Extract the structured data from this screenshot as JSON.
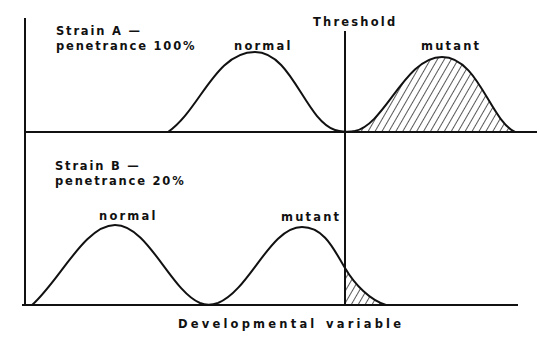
{
  "diagram": {
    "type": "penetrance threshold distributions",
    "threshold_label": "Threshold",
    "x_axis_label_left": "Developmental",
    "x_axis_label_right": "variable",
    "panels": [
      {
        "id": "strain-a",
        "title_line1": "Strain  A —",
        "title_line2": "penetrance  100%",
        "strain": "Strain A",
        "penetrance": "100%",
        "curves": [
          {
            "label": "normal",
            "hatched_beyond_threshold": false
          },
          {
            "label": "mutant",
            "hatched_beyond_threshold": true
          }
        ]
      },
      {
        "id": "strain-b",
        "title_line1": "Strain  B —",
        "title_line2": "penetrance  20%",
        "strain": "Strain B",
        "penetrance": "20%",
        "curves": [
          {
            "label": "normal",
            "hatched_beyond_threshold": false
          },
          {
            "label": "mutant",
            "hatched_beyond_threshold": true
          }
        ]
      }
    ],
    "colors": {
      "line": "#111111",
      "background": "#ffffff"
    }
  }
}
